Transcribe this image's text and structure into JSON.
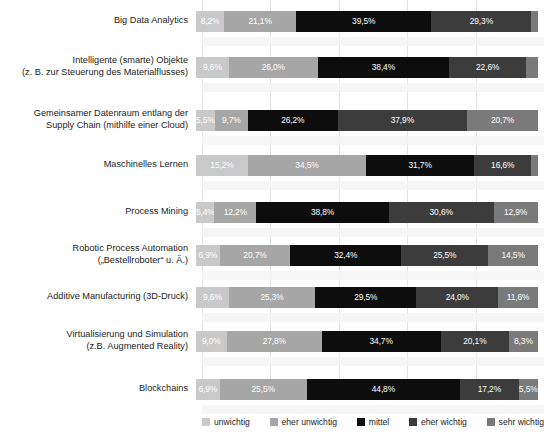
{
  "chart_data": {
    "type": "bar",
    "subtype": "stacked-horizontal-100-percent",
    "title": "",
    "xlabel": "",
    "ylabel": "",
    "xlim": [
      0,
      100
    ],
    "grid": true,
    "grid_axis": "x",
    "legend_position": "bottom",
    "value_format": "de-DE percent, comma decimal",
    "categories": [
      "Big Data Analytics",
      "Intelligente (smarte) Objekte\n(z. B. zur Steuerung des Materialflusses)",
      "Gemeinsamer Datenraum entlang der\nSupply Chain (mithilfe einer Cloud)",
      "Maschinelles Lernen",
      "Process Mining",
      "Robotic Process Automation\n(„Bestellroboter“ u. Ä.)",
      "Additive Manufacturing (3D-Druck)",
      "Virtualisierung und Simulation\n(z.B. Augmented Reality)",
      "Blockchains"
    ],
    "series": [
      {
        "name": "unwichtig",
        "color": "#c9c9c9",
        "label_color": "#ffffff",
        "values": [
          8.2,
          9.6,
          5.5,
          15.2,
          5.4,
          6.9,
          9.6,
          9.0,
          6.9
        ],
        "labels": [
          "8,2%",
          "9,6%",
          "5,5%",
          "15,2%",
          "5,4%",
          "6,9%",
          "9,6%",
          "9,0%",
          "6,9%"
        ]
      },
      {
        "name": "eher unwichtig",
        "color": "#a6a6a6",
        "label_color": "#ffffff",
        "values": [
          21.1,
          26.0,
          9.7,
          34.5,
          12.2,
          20.7,
          25.3,
          27.8,
          25.5
        ],
        "labels": [
          "21,1%",
          "26,0%",
          "9,7%",
          "34,5%",
          "12,2%",
          "20,7%",
          "25,3%",
          "27,8%",
          "25,5%"
        ]
      },
      {
        "name": "mittel",
        "color": "#0d0d0d",
        "label_color": "#ffffff",
        "values": [
          39.5,
          38.4,
          26.2,
          31.7,
          38.8,
          32.4,
          29.5,
          34.7,
          44.8
        ],
        "labels": [
          "39,5%",
          "38,4%",
          "26,2%",
          "31,7%",
          "38,8%",
          "32,4%",
          "29,5%",
          "34,7%",
          "44,8%"
        ]
      },
      {
        "name": "eher wichtig",
        "color": "#3c3c3c",
        "label_color": "#ffffff",
        "values": [
          29.3,
          22.6,
          37.9,
          16.6,
          30.6,
          25.5,
          24.0,
          20.1,
          17.2
        ],
        "labels": [
          "29,3%",
          "22,6%",
          "37,9%",
          "16,6%",
          "30,6%",
          "25,5%",
          "24,0%",
          "20,1%",
          "17,2%"
        ]
      },
      {
        "name": "sehr wichtig",
        "color": "#7a7a7a",
        "label_color": "#ffffff",
        "values": [
          1.9,
          3.4,
          20.7,
          2.0,
          12.9,
          14.5,
          11.6,
          8.3,
          5.5
        ],
        "labels": [
          "",
          "",
          "20,7%",
          "",
          "12,9%",
          "14,5%",
          "11,6%",
          "8,3%",
          "5,5%"
        ]
      }
    ],
    "gridline_positions": [
      0,
      20,
      40,
      60,
      80,
      100
    ]
  },
  "legend": {
    "items": [
      {
        "label": "unwichtig",
        "color": "#c9c9c9"
      },
      {
        "label": "eher unwichtig",
        "color": "#a6a6a6"
      },
      {
        "label": "mittel",
        "color": "#0d0d0d"
      },
      {
        "label": "eher wichtig",
        "color": "#3c3c3c"
      },
      {
        "label": "sehr wichtig",
        "color": "#7a7a7a"
      }
    ]
  }
}
